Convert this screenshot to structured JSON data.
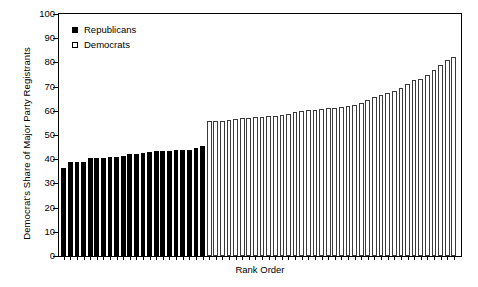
{
  "chart_data": {
    "type": "bar",
    "title": "",
    "subtitle": "",
    "xlabel": "Rank Order",
    "ylabel": "Democrat's Share of Major Party Registrants",
    "ylim": [
      0,
      100
    ],
    "yticks": [
      0,
      10,
      20,
      30,
      40,
      50,
      60,
      70,
      80,
      90,
      100
    ],
    "ytick_labels": [
      "0",
      "10",
      "20",
      "30",
      "40",
      "50",
      "60",
      "70",
      "80",
      "90",
      "100"
    ],
    "xtick_labels": [],
    "grid": false,
    "legend_position": "upper-left",
    "legend": [
      {
        "label": "Republicans",
        "marker": "filled-square",
        "color": "#000000"
      },
      {
        "label": "Democrats",
        "marker": "open-square",
        "color": "#ffffff"
      }
    ],
    "note": "Bars sorted ascending by Democrat's share; black bars are Republican-majority jurisdictions (below 50%), white bars are Democrat-majority jurisdictions (above 50%).",
    "series": [
      {
        "name": "Republicans",
        "color": "#000000",
        "values": [
          36.5,
          38.8,
          38.9,
          39.0,
          40.4,
          40.6,
          40.7,
          40.9,
          41.1,
          41.4,
          42.0,
          42.3,
          42.6,
          43.0,
          43.2,
          43.4,
          43.6,
          43.7,
          43.8,
          43.9,
          44.8,
          45.4
        ]
      },
      {
        "name": "Democrats",
        "color": "#ffffff",
        "values": [
          55.6,
          55.8,
          55.9,
          56.1,
          56.6,
          57.0,
          57.2,
          57.4,
          57.6,
          57.8,
          58.0,
          58.2,
          58.6,
          59.6,
          60.0,
          60.2,
          60.4,
          60.8,
          61.0,
          61.3,
          61.6,
          62.0,
          62.4,
          63.2,
          64.4,
          65.6,
          66.6,
          67.4,
          68.0,
          69.6,
          71.2,
          72.8,
          73.2,
          75.0,
          76.8,
          79.0,
          81.2,
          82.4
        ]
      }
    ]
  }
}
